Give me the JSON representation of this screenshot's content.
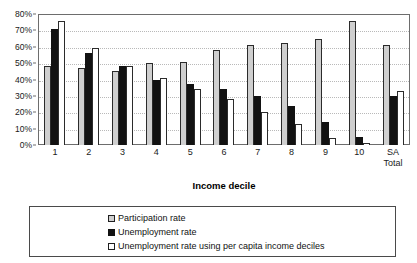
{
  "chart_data": {
    "type": "bar",
    "title": "",
    "xlabel": "Income decile",
    "ylabel": "",
    "ylim": [
      0,
      80
    ],
    "ytick_labels": [
      "80%",
      "70%",
      "60%",
      "50%",
      "40%",
      "30%",
      "20%",
      "10%",
      "0%"
    ],
    "ytick_values": [
      80,
      70,
      60,
      50,
      40,
      30,
      20,
      10,
      0
    ],
    "grid": true,
    "legend_position": "bottom",
    "categories": [
      "1",
      "2",
      "3",
      "4",
      "5",
      "6",
      "7",
      "8",
      "9",
      "10",
      "SA Total"
    ],
    "category_lines": [
      [
        "1"
      ],
      [
        "2"
      ],
      [
        "3"
      ],
      [
        "4"
      ],
      [
        "5"
      ],
      [
        "6"
      ],
      [
        "7"
      ],
      [
        "8"
      ],
      [
        "9"
      ],
      [
        "10"
      ],
      [
        "SA",
        "Total"
      ]
    ],
    "series": [
      {
        "name": "Participation rate",
        "color": "#cfcfcf",
        "values": [
          48,
          47,
          45,
          50,
          51,
          58,
          61,
          62,
          65,
          76,
          61
        ]
      },
      {
        "name": "Unemployment rate",
        "color": "#121212",
        "values": [
          71,
          56,
          48,
          40,
          37,
          34,
          30,
          24,
          14,
          5,
          30
        ]
      },
      {
        "name": "Unemployment rate using per capita income deciles",
        "color": "#ffffff",
        "values": [
          76,
          59,
          48,
          41,
          34,
          28,
          20,
          13,
          4,
          1,
          33
        ]
      }
    ]
  },
  "legend": {
    "items": [
      {
        "label": "Participation rate"
      },
      {
        "label": "Unemployment rate"
      },
      {
        "label": "Unemployment rate using per capita income deciles"
      }
    ]
  }
}
